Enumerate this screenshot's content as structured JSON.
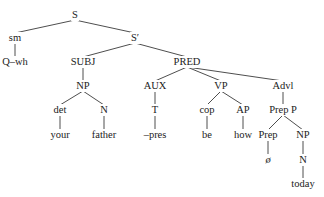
{
  "diagram": {
    "type": "syntax-tree",
    "line_color": "#3a3a3a",
    "text_color": "#222222",
    "nodes": [
      {
        "id": "S",
        "label": "S",
        "x": 75,
        "y": 15,
        "parent": null
      },
      {
        "id": "sm",
        "label": "sm",
        "x": 15,
        "y": 38,
        "parent": "S"
      },
      {
        "id": "Qwh",
        "label": "Q–wh",
        "x": 15,
        "y": 62,
        "parent": "sm"
      },
      {
        "id": "Sbar",
        "label": "S′",
        "x": 135,
        "y": 38,
        "parent": "S"
      },
      {
        "id": "SUBJ",
        "label": "SUBJ",
        "x": 83,
        "y": 62,
        "parent": "Sbar"
      },
      {
        "id": "NP1",
        "label": "NP",
        "x": 83,
        "y": 86,
        "parent": "SUBJ"
      },
      {
        "id": "det",
        "label": "det",
        "x": 60,
        "y": 110,
        "parent": "NP1"
      },
      {
        "id": "your",
        "label": "your",
        "x": 60,
        "y": 135,
        "parent": "det"
      },
      {
        "id": "N1",
        "label": "N",
        "x": 104,
        "y": 110,
        "parent": "NP1"
      },
      {
        "id": "father",
        "label": "father",
        "x": 104,
        "y": 135,
        "parent": "N1"
      },
      {
        "id": "PRED",
        "label": "PRED",
        "x": 187,
        "y": 62,
        "parent": "Sbar"
      },
      {
        "id": "AUX",
        "label": "AUX",
        "x": 155,
        "y": 86,
        "parent": "PRED"
      },
      {
        "id": "T",
        "label": "T",
        "x": 155,
        "y": 110,
        "parent": "AUX"
      },
      {
        "id": "pres",
        "label": "–pres",
        "x": 155,
        "y": 135,
        "parent": "T"
      },
      {
        "id": "VP",
        "label": "VP",
        "x": 221,
        "y": 86,
        "parent": "PRED"
      },
      {
        "id": "cop",
        "label": "cop",
        "x": 207,
        "y": 110,
        "parent": "VP"
      },
      {
        "id": "be",
        "label": "be",
        "x": 207,
        "y": 135,
        "parent": "cop"
      },
      {
        "id": "AP",
        "label": "AP",
        "x": 243,
        "y": 110,
        "parent": "VP"
      },
      {
        "id": "how",
        "label": "how",
        "x": 243,
        "y": 135,
        "parent": "AP"
      },
      {
        "id": "Advl",
        "label": "Advl",
        "x": 283,
        "y": 86,
        "parent": "PRED"
      },
      {
        "id": "PrepP",
        "label": "Prep P",
        "x": 283,
        "y": 110,
        "parent": "Advl"
      },
      {
        "id": "Prep",
        "label": "Prep",
        "x": 268,
        "y": 135,
        "parent": "PrepP"
      },
      {
        "id": "null",
        "label": "ø",
        "x": 268,
        "y": 160,
        "parent": "Prep",
        "italic": true
      },
      {
        "id": "NP2",
        "label": "NP",
        "x": 303,
        "y": 135,
        "parent": "PrepP"
      },
      {
        "id": "N2",
        "label": "N",
        "x": 303,
        "y": 160,
        "parent": "NP2"
      },
      {
        "id": "today",
        "label": "today",
        "x": 303,
        "y": 184,
        "parent": "N2"
      }
    ]
  }
}
